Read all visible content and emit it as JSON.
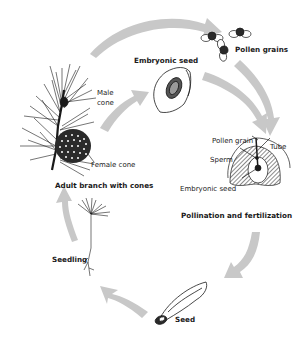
{
  "diagram": {
    "stages": [
      {
        "id": "adult",
        "label": "Adult branch with cones"
      },
      {
        "id": "embryonic",
        "label": "Embryonic seed"
      },
      {
        "id": "pollen",
        "label": "Pollen grains"
      },
      {
        "id": "pollination",
        "label": "Pollination and fertilization"
      },
      {
        "id": "seed",
        "label": "Seed"
      },
      {
        "id": "seedling",
        "label": "Seedling"
      }
    ],
    "callouts": {
      "male_cone_line1": "Male",
      "male_cone_line2": "cone",
      "female_cone": "Female cone",
      "pollen_grain": "Pollen grain",
      "tube": "Tube",
      "sperm": "Sperm",
      "embryonic_seed": "Embryonic seed"
    },
    "colors": {
      "arrow": "#c8c8c8",
      "ink": "#1a1a1a",
      "background": "#ffffff"
    }
  }
}
